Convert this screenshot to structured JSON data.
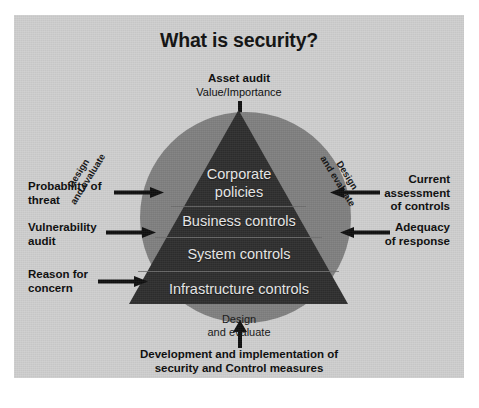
{
  "figure": {
    "title": "What is security?",
    "colors": {
      "panel_background": "#cfcfcf",
      "circle": "#808080",
      "pyramid": "#2e2e2e",
      "tier_text": "#e9e9e9",
      "label_text": "#0c0c0c",
      "page_background": "#ffffff"
    },
    "top_callout": {
      "line1": "Asset audit",
      "line2": "Value/Importance",
      "arrow": "arrow-down"
    },
    "pyramid_tiers": [
      {
        "label_line1": "Corporate",
        "label_line2": "policies"
      },
      {
        "label_line1": "Business controls",
        "label_line2": ""
      },
      {
        "label_line1": "System controls",
        "label_line2": ""
      },
      {
        "label_line1": "Infrastructure controls",
        "label_line2": ""
      }
    ],
    "shoulder_labels": [
      {
        "line1": "Design",
        "line2": "and evaluate",
        "side": "left"
      },
      {
        "line1": "Design",
        "line2": "and evaluate",
        "side": "right"
      }
    ],
    "inner_bottom_label": {
      "line1": "Design",
      "line2": "and evaluate"
    },
    "left_callouts": [
      {
        "line1": "Probability of",
        "line2": "threat",
        "arrow": "arrow-right"
      },
      {
        "line1": "Vulnerability",
        "line2": "audit",
        "arrow": "arrow-right"
      },
      {
        "line1": "Reason for",
        "line2": "concern",
        "arrow": "arrow-right"
      }
    ],
    "right_callouts": [
      {
        "line1": "Current",
        "line2": "assessment",
        "line3": "of controls",
        "arrow": "arrow-left"
      },
      {
        "line1": "Adequacy",
        "line2": "of response",
        "line3": "",
        "arrow": "arrow-left"
      }
    ],
    "bottom_caption": {
      "line1": "Development and implementation of",
      "line2": "security and Control measures",
      "arrow": "arrow-up"
    }
  }
}
